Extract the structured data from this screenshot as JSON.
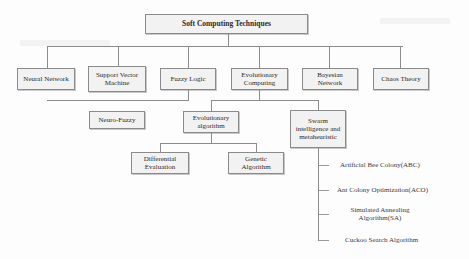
{
  "diagram": {
    "title": "Soft Computing Techniques",
    "level1": [
      {
        "label": "Neural Network"
      },
      {
        "label": "Support Vector Machine"
      },
      {
        "label": "Fuzzy Logic"
      },
      {
        "label": "Evolutionary Computing"
      },
      {
        "label": "Bayesian Network"
      },
      {
        "label": "Chaos Theory"
      }
    ],
    "fuzzy_children": [
      {
        "label": "Neuro-Fuzzy"
      }
    ],
    "evolutionary_children": [
      {
        "label": "Evolutionary algorithm"
      },
      {
        "label": "Swarm intelligence and metaheuristic"
      }
    ],
    "evolutionary_algorithm_children": [
      {
        "label": "Differential Evaluation"
      },
      {
        "label": "Genetic Algorithm"
      }
    ],
    "swarm_children": [
      {
        "label": "Artificial Bee Colony(ABC)"
      },
      {
        "label": "Ant Colony Optimization(ACO)"
      },
      {
        "label": "Simulated Annealing Algorithm(SA)"
      },
      {
        "label": "Cuckoo Search Algorithm"
      }
    ]
  }
}
